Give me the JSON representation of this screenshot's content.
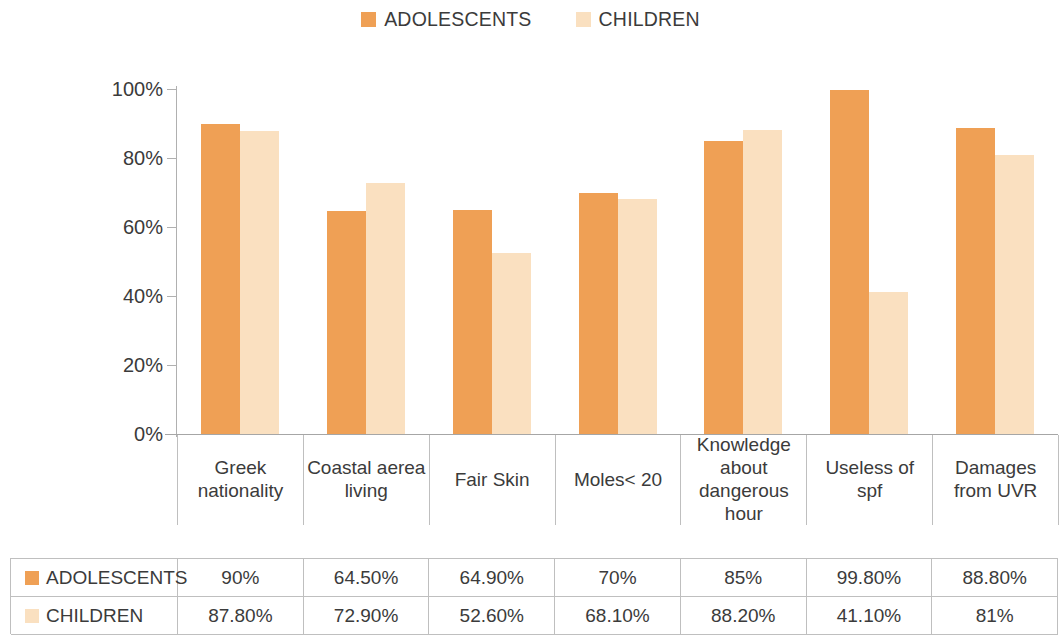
{
  "legend": {
    "items": [
      {
        "label": "ADOLESCENTS",
        "color": "#efa055"
      },
      {
        "label": "CHILDREN",
        "color": "#fae0c0"
      }
    ]
  },
  "axis": {
    "ticks": [
      "100%",
      "80%",
      "60%",
      "40%",
      "20%",
      "0%"
    ]
  },
  "categories": [
    "Greek nationality",
    "Coastal aerea living",
    "Fair Skin",
    "Moles< 20",
    "Knowledge about dangerous hour",
    "Useless of spf",
    "Damages from UVR"
  ],
  "table": {
    "rows": [
      {
        "label": "ADOLESCENTS",
        "color": "#efa055",
        "values": [
          "90%",
          "64.50%",
          "64.90%",
          "70%",
          "85%",
          "99.80%",
          "88.80%"
        ]
      },
      {
        "label": "CHILDREN",
        "color": "#fae0c0",
        "values": [
          "87.80%",
          "72.90%",
          "52.60%",
          "68.10%",
          "88.20%",
          "41.10%",
          "81%"
        ]
      }
    ]
  },
  "chart_data": {
    "type": "bar",
    "title": "",
    "xlabel": "",
    "ylabel": "",
    "ylim": [
      0,
      100
    ],
    "grid": false,
    "legend_position": "top-center",
    "categories": [
      "Greek nationality",
      "Coastal aerea living",
      "Fair Skin",
      "Moles< 20",
      "Knowledge about dangerous hour",
      "Useless of spf",
      "Damages from UVR"
    ],
    "tick_labels": [
      "0%",
      "20%",
      "40%",
      "60%",
      "80%",
      "100%"
    ],
    "series": [
      {
        "name": "ADOLESCENTS",
        "color": "#efa055",
        "values": [
          90,
          64.5,
          64.9,
          70,
          85,
          99.8,
          88.8
        ],
        "value_labels": [
          "90%",
          "64.50%",
          "64.90%",
          "70%",
          "85%",
          "99.80%",
          "88.80%"
        ]
      },
      {
        "name": "CHILDREN",
        "color": "#fae0c0",
        "values": [
          87.8,
          72.9,
          52.6,
          68.1,
          88.2,
          41.1,
          81
        ],
        "value_labels": [
          "87.80%",
          "72.90%",
          "52.60%",
          "68.10%",
          "88.20%",
          "41.10%",
          "81%"
        ]
      }
    ]
  }
}
